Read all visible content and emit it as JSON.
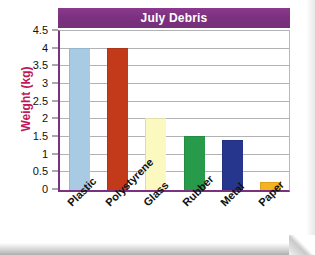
{
  "chart_data": {
    "type": "bar",
    "title": "July Debris",
    "xlabel": "",
    "ylabel": "Weight (kg)",
    "categories": [
      "Plastic",
      "Polystyrene",
      "Glass",
      "Rubber",
      "Metal",
      "Paper"
    ],
    "values": [
      4,
      4,
      2,
      1.5,
      1.4,
      0.2
    ],
    "bar_colors": [
      "#a8cbe3",
      "#c33a1b",
      "#fbf8c0",
      "#289b4a",
      "#26368c",
      "#f5b320"
    ],
    "ylim": [
      0,
      4.5
    ],
    "ytick_labels": [
      "0",
      "0.5",
      "1",
      "1.5",
      "2",
      "2.5",
      "3",
      "3.5",
      "4",
      "4.5"
    ],
    "ytick_values": [
      0,
      0.5,
      1,
      1.5,
      2,
      2.5,
      3,
      3.5,
      4,
      4.5
    ],
    "grid": true,
    "legend": "none",
    "title_bar_color": "#7c3080",
    "title_text_color": "#ffffff",
    "axis_color": "#7c3080",
    "gridline_color": "#b2b2b6",
    "ylabel_color": "#c2185b"
  }
}
